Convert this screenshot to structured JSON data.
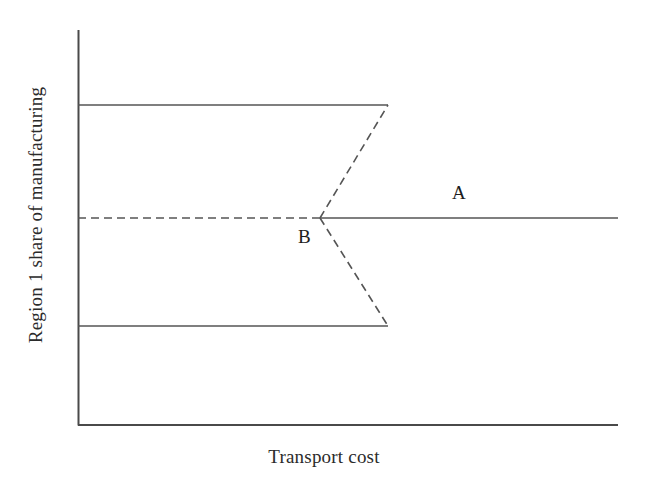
{
  "figure": {
    "kind": "bifurcation-diagram",
    "background_color": "#ffffff",
    "line_color": "#555555",
    "axis_color": "#4a4a4a",
    "text_color": "#1c1c1c"
  },
  "axes": {
    "x_label": "Transport cost",
    "y_label": "Region 1 share of manufacturing",
    "x_axis_from": [
      78,
      425
    ],
    "x_axis_to": [
      618,
      425
    ],
    "y_axis_from": [
      78,
      30
    ],
    "y_axis_to": [
      78,
      425
    ],
    "ticks": [],
    "tick_labels": []
  },
  "annotations": [
    {
      "text": "A",
      "x": 460,
      "y": 196
    },
    {
      "text": "B",
      "x": 306,
      "y": 240
    }
  ],
  "chart_data": {
    "type": "line",
    "title": "",
    "subtitle": "",
    "xlabel": "Transport cost",
    "ylabel": "Region 1 share of manufacturing",
    "xlim": [
      0,
      1
    ],
    "ylim": [
      0,
      1
    ],
    "grid": false,
    "legend": "none",
    "axis_ticks_shown": false,
    "series": [
      {
        "name": "upper-stable-branch",
        "style": "solid",
        "stability": "stable",
        "points": [
          [
            78,
            105
          ],
          [
            388,
            105
          ]
        ],
        "x": [
          0.0,
          0.574
        ],
        "y": [
          0.81,
          0.81
        ]
      },
      {
        "name": "lower-stable-branch",
        "style": "solid",
        "stability": "stable",
        "points": [
          [
            78,
            326
          ],
          [
            388,
            326
          ]
        ],
        "x": [
          0.0,
          0.574
        ],
        "y": [
          0.25,
          0.25
        ]
      },
      {
        "name": "symmetric-unstable-branch",
        "style": "dashed",
        "stability": "unstable",
        "points": [
          [
            78,
            218
          ],
          [
            320,
            218
          ]
        ],
        "x": [
          0.0,
          0.448
        ],
        "y": [
          0.5,
          0.5
        ]
      },
      {
        "name": "symmetric-stable-branch",
        "style": "solid",
        "stability": "stable",
        "points": [
          [
            320,
            218
          ],
          [
            618,
            218
          ]
        ],
        "x": [
          0.448,
          1.0
        ],
        "y": [
          0.5,
          0.5
        ]
      },
      {
        "name": "upper-unstable-branch",
        "style": "dashed",
        "stability": "unstable",
        "points": [
          [
            320,
            218
          ],
          [
            388,
            105
          ]
        ],
        "x": [
          0.448,
          0.574
        ],
        "y": [
          0.5,
          0.81
        ]
      },
      {
        "name": "lower-unstable-branch",
        "style": "dashed",
        "stability": "unstable",
        "points": [
          [
            320,
            218
          ],
          [
            388,
            326
          ]
        ],
        "x": [
          0.448,
          0.574
        ],
        "y": [
          0.5,
          0.25
        ]
      }
    ],
    "annotations": [
      {
        "label": "A",
        "x": 0.71,
        "y": 0.56,
        "note": "stable symmetric equilibrium branch"
      },
      {
        "label": "B",
        "x": 0.43,
        "y": 0.44,
        "note": "bifurcation (break) point"
      }
    ]
  }
}
